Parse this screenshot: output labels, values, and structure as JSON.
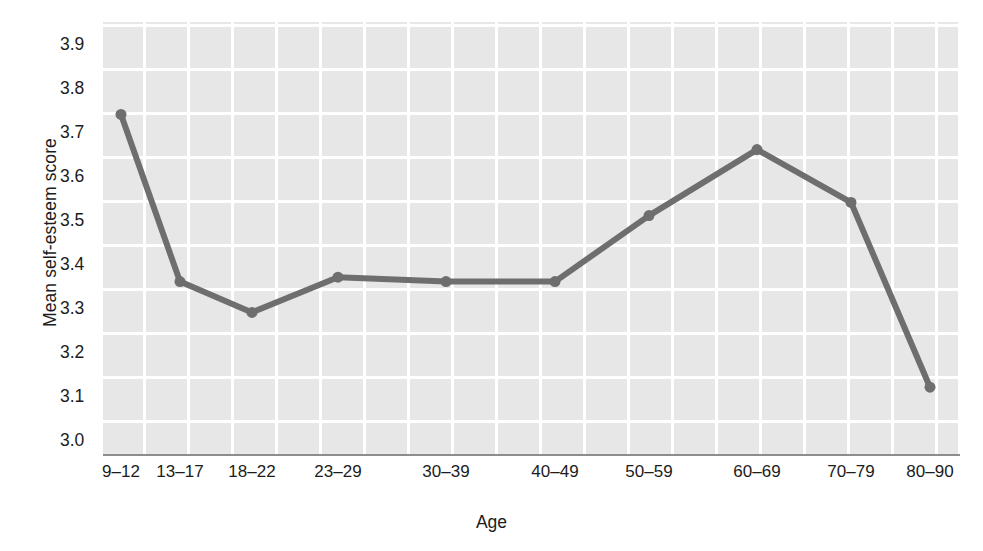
{
  "chart_data": {
    "type": "line",
    "title": "",
    "xlabel": "Age",
    "ylabel": "Mean self-esteem score",
    "categories": [
      "9–12",
      "13–17",
      "18–22",
      "23–29",
      "30–39",
      "40–49",
      "50–59",
      "60–69",
      "70–79",
      "80–90"
    ],
    "values": [
      3.74,
      3.36,
      3.29,
      3.37,
      3.36,
      3.36,
      3.51,
      3.66,
      3.54,
      3.12
    ],
    "series": [
      {
        "name": "Mean self-esteem score",
        "values": [
          3.74,
          3.36,
          3.29,
          3.37,
          3.36,
          3.36,
          3.51,
          3.66,
          3.54,
          3.12
        ]
      }
    ],
    "ylim": [
      2.95,
      3.95
    ],
    "yticks": [
      "3.0",
      "3.1",
      "3.2",
      "3.3",
      "3.4",
      "3.5",
      "3.6",
      "3.7",
      "3.8",
      "3.9"
    ],
    "ytick_values": [
      3.0,
      3.1,
      3.2,
      3.3,
      3.4,
      3.5,
      3.6,
      3.7,
      3.8,
      3.9
    ],
    "grid": "horizontal-and-vertical",
    "legend": "none",
    "marker": "circle",
    "colors": {
      "line": "#6e6e6e",
      "marker": "#6e6e6e",
      "panel_background": "#e7e7e7",
      "gridline": "#ffffff",
      "axis_line": "#8d8d8d",
      "text": "#1c1c1c",
      "figure_background": "#ffffff"
    }
  }
}
